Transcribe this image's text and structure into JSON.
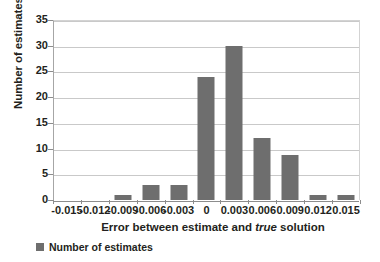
{
  "chart_data": {
    "type": "bar",
    "title": "",
    "subtitle": "",
    "xlabel_parts": {
      "before": "Error between estimate and ",
      "italic": "true",
      "after": " solution"
    },
    "xlabel": "Error between estimate and true solution",
    "ylabel": "Number of estimates",
    "categories": [
      "-0.015",
      "-0.012",
      "-0.009",
      "-0.006",
      "-0.003",
      "0",
      "0.003",
      "0.006",
      "0.009",
      "0.012",
      "0.015"
    ],
    "values": [
      0,
      0,
      1,
      3,
      3,
      24,
      30,
      12,
      8.7,
      1,
      1
    ],
    "series": [
      {
        "name": "Number of estimates",
        "values": [
          0,
          0,
          1,
          3,
          3,
          24,
          30,
          12,
          8.7,
          1,
          1
        ],
        "color": "#6e6e6e"
      }
    ],
    "ylim": [
      0,
      35
    ],
    "yticks": [
      0,
      5,
      10,
      15,
      20,
      25,
      30,
      35
    ],
    "ytick_labels": [
      "0",
      "5",
      "10",
      "15",
      "20",
      "25",
      "30",
      "35"
    ],
    "grid": true,
    "grid_axis": "y",
    "legend": {
      "position": "bottom-left",
      "entries": [
        {
          "label": "Number of estimates",
          "color": "#6e6e6e"
        }
      ]
    },
    "colors": {
      "bar": "#6e6e6e",
      "grid": "#c9c9c9",
      "axis": "#8d8d8d",
      "text": "#231f20",
      "background": "#ffffff"
    }
  }
}
